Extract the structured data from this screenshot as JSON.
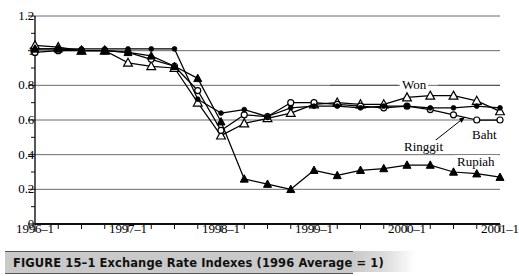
{
  "figure": {
    "caption": "FIGURE 15–1  Exchange Rate Indexes (1996 Average = 1)",
    "caption_number": "FIGURE 15–1",
    "caption_title": "Exchange Rate Indexes (1996 Average = 1)"
  },
  "annotations": {
    "won": "Won",
    "baht": "Baht",
    "ringgit": "Ringgit",
    "rupiah": "Rupiah"
  },
  "axes": {
    "y_ticks": [
      "1.2",
      "1",
      "0.8",
      "0.6",
      "0.4",
      "0.2",
      "0"
    ],
    "x_ticks": [
      "1996–1",
      "1997–1",
      "1998–1",
      "1999–1",
      "2000–1",
      "2001–1"
    ]
  },
  "chart_data": {
    "type": "line",
    "title": "Exchange Rate Indexes (1996 Average = 1)",
    "xlabel": "",
    "ylabel": "",
    "ylim": [
      0,
      1.2
    ],
    "ytick_values": [
      0,
      0.2,
      0.4,
      0.6,
      0.8,
      1.0,
      1.2
    ],
    "grid": true,
    "legend": "inline-labels",
    "x": [
      "1996-1",
      "1996-2",
      "1996-3",
      "1996-4",
      "1997-1",
      "1997-2",
      "1997-3",
      "1997-4",
      "1998-1",
      "1998-2",
      "1998-3",
      "1998-4",
      "1999-1",
      "1999-2",
      "1999-3",
      "1999-4",
      "2000-1",
      "2000-2",
      "2000-3",
      "2000-4",
      "2001-1"
    ],
    "xtick_labels": [
      "1996–1",
      "",
      "",
      "",
      "1997–1",
      "",
      "",
      "",
      "1998–1",
      "",
      "",
      "",
      "1999–1",
      "",
      "",
      "",
      "2000–1",
      "",
      "",
      "",
      "2001–1"
    ],
    "series": [
      {
        "name": "Won",
        "marker": "open-triangle",
        "values": [
          1.03,
          1.02,
          1.0,
          1.0,
          0.93,
          0.91,
          0.9,
          0.7,
          0.51,
          0.58,
          0.61,
          0.64,
          0.69,
          0.7,
          0.69,
          0.69,
          0.73,
          0.74,
          0.74,
          0.71,
          0.65
        ]
      },
      {
        "name": "Baht",
        "marker": "open-circle",
        "values": [
          0.99,
          1.0,
          1.0,
          1.0,
          0.99,
          0.95,
          0.91,
          0.77,
          0.54,
          0.63,
          0.62,
          0.7,
          0.7,
          0.69,
          0.68,
          0.67,
          0.68,
          0.66,
          0.63,
          0.6,
          0.6
        ]
      },
      {
        "name": "Ringgit",
        "marker": "filled-circle",
        "values": [
          1.01,
          1.01,
          1.01,
          1.01,
          1.01,
          1.01,
          1.01,
          0.72,
          0.64,
          0.66,
          0.62,
          0.67,
          0.68,
          0.68,
          0.67,
          0.68,
          0.68,
          0.67,
          0.67,
          0.68,
          0.67
        ]
      },
      {
        "name": "Rupiah",
        "marker": "filled-triangle",
        "values": [
          1.01,
          1.01,
          1.0,
          1.0,
          0.99,
          0.97,
          0.91,
          0.84,
          0.59,
          0.26,
          0.23,
          0.2,
          0.31,
          0.28,
          0.31,
          0.32,
          0.34,
          0.34,
          0.3,
          0.29,
          0.27
        ]
      }
    ]
  }
}
